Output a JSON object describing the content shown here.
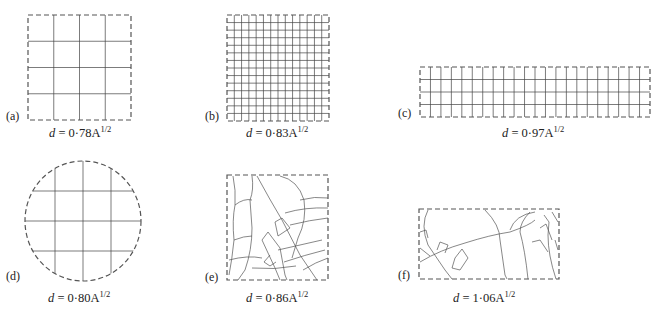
{
  "panels": [
    {
      "id": "a",
      "label": "(a)",
      "shape": "square grid 4x4",
      "formula": {
        "var": "d",
        "eq": " = 0·78A",
        "exp": "1/2"
      }
    },
    {
      "id": "b",
      "label": "(b)",
      "shape": "square grid 14x14",
      "formula": {
        "var": "d",
        "eq": " = 0·83A",
        "exp": "1/2"
      }
    },
    {
      "id": "c",
      "label": "(c)",
      "shape": "rectangular grid 22x4",
      "formula": {
        "var": "d",
        "eq": " = 0·97A",
        "exp": "1/2"
      }
    },
    {
      "id": "d",
      "label": "(d)",
      "shape": "circle with grid",
      "formula": {
        "var": "d",
        "eq": " = 0·80A",
        "exp": "1/2"
      }
    },
    {
      "id": "e",
      "label": "(e)",
      "shape": "square irregular street network",
      "formula": {
        "var": "d",
        "eq": " = 0·86A",
        "exp": "1/2"
      }
    },
    {
      "id": "f",
      "label": "(f)",
      "shape": "rectangle irregular street network",
      "formula": {
        "var": "d",
        "eq": " = 1·06A",
        "exp": "1/2"
      }
    }
  ],
  "colors": {
    "line": "#444444",
    "border": "#555555",
    "background": "#ffffff"
  }
}
